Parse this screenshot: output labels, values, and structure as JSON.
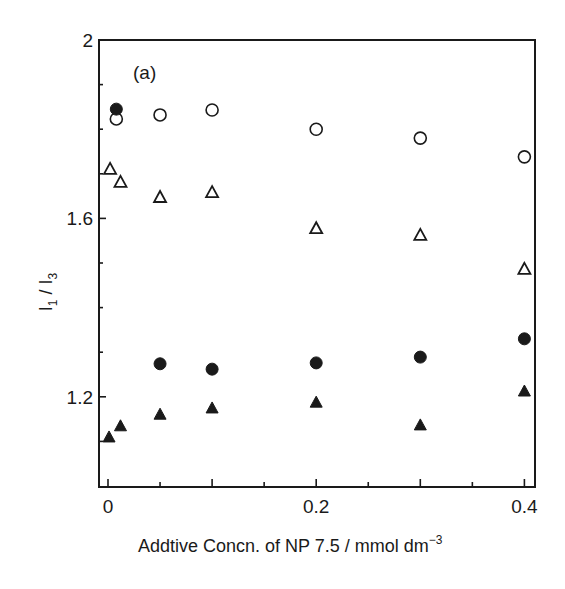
{
  "chart_data": {
    "type": "scatter",
    "title": "",
    "panel_label": "(a)",
    "xlabel": "Addtive Concn. of NP 7.5 / mmol dm",
    "xlabel_superscript": "−3",
    "ylabel_main": "I",
    "ylabel_sub1": "1",
    "ylabel_sep": " / I",
    "ylabel_sub2": "3",
    "ylabel": "I1 / I3",
    "xlim": [
      -0.009,
      0.41
    ],
    "ylim": [
      1.0,
      2.0
    ],
    "x_major_ticks": [
      0,
      0.1,
      0.2,
      0.3,
      0.4
    ],
    "x_minor_ticks": [
      0.05,
      0.15,
      0.25,
      0.35
    ],
    "x_tick_labels": [
      {
        "value": 0,
        "label": "0"
      },
      {
        "value": 0.2,
        "label": "0.2"
      },
      {
        "value": 0.4,
        "label": "0.4"
      }
    ],
    "y_major_ticks": [
      1.2,
      1.6,
      2.0
    ],
    "y_minor_ticks": [
      1.1,
      1.3,
      1.4,
      1.5,
      1.7,
      1.8,
      1.9
    ],
    "y_tick_labels": [
      {
        "value": 2.0,
        "label": "2"
      },
      {
        "value": 1.6,
        "label": "1.6"
      },
      {
        "value": 1.2,
        "label": "1.2"
      }
    ],
    "grid": false,
    "legend": null,
    "series": [
      {
        "name": "open circles",
        "marker": "circle-open",
        "points": [
          {
            "x": 0.008,
            "y": 1.823
          },
          {
            "x": 0.05,
            "y": 1.832
          },
          {
            "x": 0.1,
            "y": 1.843
          },
          {
            "x": 0.2,
            "y": 1.8
          },
          {
            "x": 0.3,
            "y": 1.78
          },
          {
            "x": 0.4,
            "y": 1.738
          }
        ]
      },
      {
        "name": "filled circles",
        "marker": "circle-filled",
        "points": [
          {
            "x": 0.008,
            "y": 1.845
          },
          {
            "x": 0.05,
            "y": 1.274
          },
          {
            "x": 0.1,
            "y": 1.262
          },
          {
            "x": 0.2,
            "y": 1.276
          },
          {
            "x": 0.3,
            "y": 1.289
          },
          {
            "x": 0.4,
            "y": 1.33
          }
        ]
      },
      {
        "name": "open triangles",
        "marker": "triangle-open",
        "points": [
          {
            "x": 0.002,
            "y": 1.711
          },
          {
            "x": 0.012,
            "y": 1.682
          },
          {
            "x": 0.05,
            "y": 1.648
          },
          {
            "x": 0.1,
            "y": 1.659
          },
          {
            "x": 0.2,
            "y": 1.578
          },
          {
            "x": 0.3,
            "y": 1.563
          },
          {
            "x": 0.4,
            "y": 1.487
          }
        ]
      },
      {
        "name": "filled triangles",
        "marker": "triangle-filled",
        "points": [
          {
            "x": 0.001,
            "y": 1.11
          },
          {
            "x": 0.012,
            "y": 1.135
          },
          {
            "x": 0.05,
            "y": 1.161
          },
          {
            "x": 0.1,
            "y": 1.175
          },
          {
            "x": 0.2,
            "y": 1.188
          },
          {
            "x": 0.3,
            "y": 1.137
          },
          {
            "x": 0.4,
            "y": 1.213
          }
        ]
      }
    ],
    "colors": {
      "ink": "#1a1a1a",
      "background": "#ffffff"
    }
  }
}
